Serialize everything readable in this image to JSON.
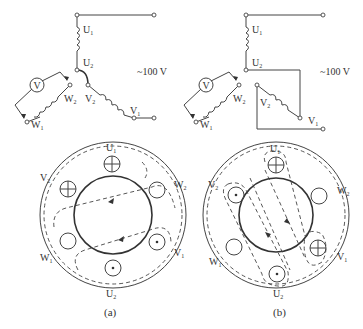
{
  "diagrams": [
    {
      "id": "a",
      "caption": "(a)",
      "supply_label": "~100 V",
      "voltmeter_label": "V",
      "terminals": {
        "U1": "U",
        "U2": "U",
        "V1": "V",
        "V2": "V",
        "W1": "W",
        "W2": "W"
      },
      "terminal_subs": {
        "U1": "1",
        "U2": "2",
        "V1": "1",
        "V2": "2",
        "W1": "1",
        "W2": "2"
      },
      "circle_labels": {
        "U1": "U",
        "U2": "U",
        "V1": "V",
        "V2": "V",
        "W1": "W",
        "W2": "W"
      }
    },
    {
      "id": "b",
      "caption": "(b)",
      "supply_label": "~100 V",
      "voltmeter_label": "V",
      "terminals": {
        "U1": "U",
        "U2": "U",
        "V1": "V",
        "V2": "V",
        "W1": "W",
        "W2": "W"
      },
      "terminal_subs": {
        "U1": "1",
        "U2": "2",
        "V1": "1",
        "V2": "2",
        "W1": "1",
        "W2": "2"
      },
      "circle_labels": {
        "U1": "U",
        "U2": "U",
        "V1": "V",
        "V2": "V",
        "W1": "W",
        "W2": "W"
      }
    }
  ],
  "colors": {
    "line": "#444444",
    "background": "#ffffff"
  }
}
